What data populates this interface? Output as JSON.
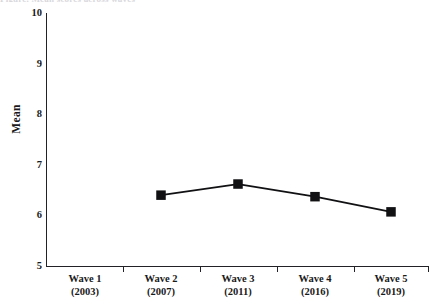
{
  "figure": {
    "top_caption_clipped": "Figure. Mean scores across waves",
    "background_color": "#ffffff",
    "line_color": "#111114",
    "marker_color": "#111114",
    "axis_color": "#222226"
  },
  "chart_data": {
    "type": "line",
    "title": "",
    "xlabel": "",
    "ylabel": "Mean",
    "categories": [
      "Wave 1\n(2003)",
      "Wave 2\n(2007)",
      "Wave 3\n(2011)",
      "Wave 4\n(2016)",
      "Wave 5\n(2019)"
    ],
    "x_tick_labels": [
      {
        "wave": "Wave 1",
        "year": "(2003)"
      },
      {
        "wave": "Wave 2",
        "year": "(2007)"
      },
      {
        "wave": "Wave 3",
        "year": "(2011)"
      },
      {
        "wave": "Wave 4",
        "year": "(2016)"
      },
      {
        "wave": "Wave 5",
        "year": "(2019)"
      }
    ],
    "y_tick_labels": [
      "10",
      "9",
      "8",
      "7",
      "6",
      "5"
    ],
    "y_ticks": [
      10,
      9,
      8,
      7,
      6,
      5
    ],
    "ylim": [
      5,
      10
    ],
    "grid": false,
    "legend": "none",
    "marker": "square",
    "series": [
      {
        "name": "Mean",
        "x": [
          "Wave 1 (2003)",
          "Wave 2 (2007)",
          "Wave 3 (2011)",
          "Wave 4 (2016)",
          "Wave 5 (2019)"
        ],
        "values": [
          null,
          6.4,
          6.62,
          6.37,
          6.07
        ]
      }
    ]
  }
}
